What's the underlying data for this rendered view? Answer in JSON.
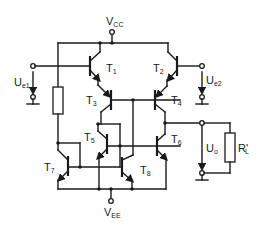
{
  "diagram": {
    "type": "circuit-schematic",
    "supply": {
      "positive": {
        "main": "V",
        "sub": "CC"
      },
      "negative": {
        "main": "V",
        "sub": "EE"
      }
    },
    "inputs": [
      {
        "main": "U",
        "sub": "e1"
      },
      {
        "main": "U",
        "sub": "e2"
      }
    ],
    "output": {
      "main": "U",
      "sub": "o"
    },
    "load": {
      "main": "R",
      "sub": "L",
      "prime": "'"
    },
    "transistors": [
      {
        "main": "T",
        "sub": "1"
      },
      {
        "main": "T",
        "sub": "2"
      },
      {
        "main": "T",
        "sub": "3"
      },
      {
        "main": "T",
        "sub": "4"
      },
      {
        "main": "T",
        "sub": "5"
      },
      {
        "main": "T",
        "sub": "6"
      },
      {
        "main": "T",
        "sub": "7"
      },
      {
        "main": "T",
        "sub": "8"
      }
    ],
    "colors": {
      "line": "#1a1a1a",
      "background": "#ffffff"
    }
  }
}
